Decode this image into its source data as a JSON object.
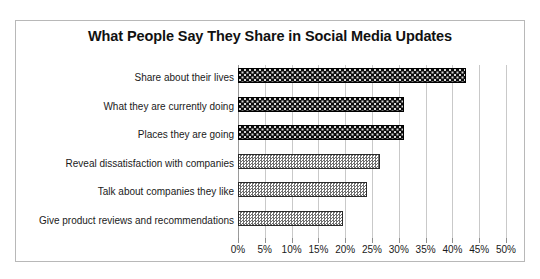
{
  "chart_data": {
    "type": "bar",
    "orientation": "horizontal",
    "title": "What People Say They Share in Social Media Updates",
    "xlabel": "",
    "ylabel": "",
    "xlim": [
      0,
      50
    ],
    "xtick_labels": [
      "0%",
      "5%",
      "10%",
      "15%",
      "20%",
      "25%",
      "30%",
      "35%",
      "40%",
      "45%",
      "50%"
    ],
    "xticks": [
      0,
      5,
      10,
      15,
      20,
      25,
      30,
      35,
      40,
      45,
      50
    ],
    "grid": "vertical",
    "legend": "none",
    "categories": [
      "Share about their lives",
      "What they are currently doing",
      "Places they are going",
      "Reveal dissatisfaction with companies",
      "Talk about companies they like",
      "Give product reviews and recommendations"
    ],
    "values": [
      42.5,
      31,
      31,
      26.5,
      24,
      19.5
    ],
    "bar_styles": [
      "dark",
      "dark",
      "dark",
      "light",
      "light",
      "light"
    ],
    "colors": {
      "dark_bar": "#0b0b0b",
      "light_bar": "#6e6e6e",
      "gridline": "#c9c9c9",
      "axis": "#9a9a9a",
      "border": "#b8b8b8",
      "text": "#1a1a1a"
    }
  }
}
